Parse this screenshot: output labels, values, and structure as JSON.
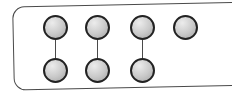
{
  "figure": {
    "kind": "counters-pairing-diagram",
    "total_counters": 7,
    "top_row_count": 4,
    "bottom_row_count": 3,
    "pair_count": 3,
    "unpaired_count": 1,
    "columns": [
      {
        "top": true,
        "bottom": true,
        "paired": true
      },
      {
        "top": true,
        "bottom": true,
        "paired": true
      },
      {
        "top": true,
        "bottom": true,
        "paired": true
      },
      {
        "top": true,
        "bottom": false,
        "paired": false
      }
    ],
    "colors": {
      "background": "#ffffff",
      "panel_fill": "#ffffff",
      "panel_border": "#4a4a4a",
      "counter_outline": "#222222",
      "counter_fill": "#c9c9c9",
      "counter_highlight": "#ececec",
      "counter_shadow": "#a3a3a3",
      "connector": "#4a4a4a"
    }
  }
}
